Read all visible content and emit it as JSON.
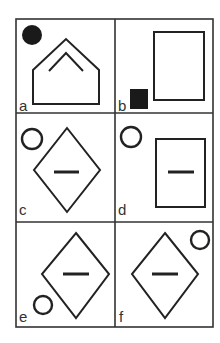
{
  "puzzle": {
    "type": "visual-analogy-grid",
    "rows": 3,
    "columns": 2,
    "cells": [
      {
        "label": "a",
        "shapes": [
          "pentagon-house-outline",
          "inner-chevron",
          "filled-circle-top-left"
        ]
      },
      {
        "label": "b",
        "shapes": [
          "rectangle-outline",
          "filled-square-bottom-left"
        ]
      },
      {
        "label": "c",
        "shapes": [
          "diamond-outline",
          "inner-horizontal-dash",
          "hollow-circle-top-left"
        ]
      },
      {
        "label": "d",
        "shapes": [
          "rectangle-outline",
          "inner-horizontal-dash",
          "hollow-circle-top-left"
        ]
      },
      {
        "label": "e",
        "shapes": [
          "diamond-outline",
          "inner-horizontal-dash",
          "hollow-circle-bottom-left"
        ]
      },
      {
        "label": "f",
        "shapes": [
          "diamond-outline",
          "inner-horizontal-dash",
          "hollow-circle-top-right"
        ]
      }
    ],
    "colors": {
      "stroke": "#222222",
      "fill": "#1a1a1a",
      "label": "#333333",
      "background": "#ffffff"
    }
  }
}
